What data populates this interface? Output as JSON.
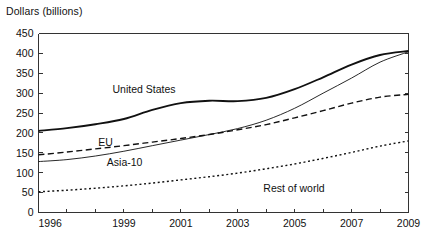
{
  "chart_title": "Dollars (billions)",
  "axes": {
    "y_label": "Dollars (billions)",
    "y_ticks": [
      "0",
      "50",
      "100",
      "150",
      "200",
      "250",
      "300",
      "350",
      "400",
      "450"
    ],
    "x_ticks": [
      "1996",
      "1999",
      "2001",
      "2003",
      "2005",
      "2007",
      "2009"
    ]
  },
  "series_labels": {
    "united_states": "United States",
    "eu": "EU",
    "asia_10": "Asia-10",
    "rest_of_world": "Rest of world"
  },
  "chart_data": {
    "type": "line",
    "title": "Dollars (billions)",
    "xlabel": "",
    "ylabel": "Dollars (billions)",
    "xlim": [
      1996,
      2009
    ],
    "ylim": [
      0,
      450
    ],
    "ytick_step": 50,
    "grid": false,
    "legend": "inline-labels",
    "x": [
      1996,
      1997,
      1998,
      1999,
      2000,
      2001,
      2002,
      2003,
      2004,
      2005,
      2006,
      2007,
      2008,
      2009
    ],
    "series": [
      {
        "name": "United States",
        "style": "solid-thick",
        "color": "#111111",
        "values": [
          205,
          212,
          222,
          235,
          258,
          275,
          281,
          280,
          288,
          310,
          340,
          372,
          396,
          406
        ]
      },
      {
        "name": "EU",
        "style": "dashed",
        "color": "#111111",
        "values": [
          145,
          152,
          160,
          168,
          177,
          186,
          196,
          208,
          221,
          238,
          256,
          275,
          290,
          297
        ]
      },
      {
        "name": "Asia-10",
        "style": "solid-thin",
        "color": "#111111",
        "values": [
          128,
          133,
          142,
          154,
          168,
          182,
          196,
          211,
          232,
          262,
          300,
          338,
          378,
          404
        ]
      },
      {
        "name": "Rest of world",
        "style": "dotted",
        "color": "#111111",
        "values": [
          52,
          56,
          61,
          67,
          74,
          82,
          90,
          99,
          110,
          122,
          136,
          151,
          167,
          180
        ]
      }
    ],
    "annotations": [
      {
        "text": "United States",
        "x": 1998.6,
        "y": 300
      },
      {
        "text": "EU",
        "x": 1998.1,
        "y": 168
      },
      {
        "text": "Asia-10",
        "x": 1998.4,
        "y": 118
      },
      {
        "text": "Rest of world",
        "x": 2003.9,
        "y": 52
      }
    ]
  }
}
